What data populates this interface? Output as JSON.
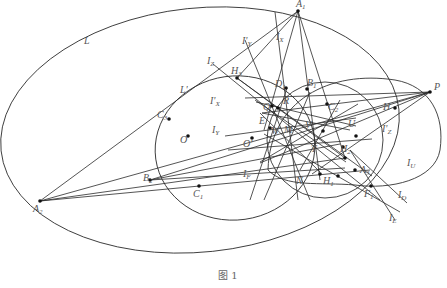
{
  "figure": {
    "caption": "图 1",
    "labels": [
      {
        "id": "L",
        "text": "L",
        "sub": ""
      },
      {
        "id": "Lp",
        "text": "L'",
        "sub": ""
      },
      {
        "id": "IZ",
        "text": "I",
        "sub": "Z"
      },
      {
        "id": "IpY",
        "text": "I'",
        "sub": "Y"
      },
      {
        "id": "IX",
        "text": "I",
        "sub": "X"
      },
      {
        "id": "A1",
        "text": "A",
        "sub": "1"
      },
      {
        "id": "H3",
        "text": "H",
        "sub": "3"
      },
      {
        "id": "D1",
        "text": "D",
        "sub": "1"
      },
      {
        "id": "B1",
        "text": "B",
        "sub": "1"
      },
      {
        "id": "C3",
        "text": "C",
        "sub": "3"
      },
      {
        "id": "Q",
        "text": "Q",
        "sub": ""
      },
      {
        "id": "R",
        "text": "R",
        "sub": ""
      },
      {
        "id": "C2",
        "text": "C",
        "sub": "2"
      },
      {
        "id": "H",
        "text": "H",
        "sub": ""
      },
      {
        "id": "P",
        "text": "P",
        "sub": ""
      },
      {
        "id": "IpX",
        "text": "I'",
        "sub": "X"
      },
      {
        "id": "IY",
        "text": "I",
        "sub": "Y"
      },
      {
        "id": "O",
        "text": "O",
        "sub": ""
      },
      {
        "id": "E",
        "text": "E",
        "sub": ""
      },
      {
        "id": "W",
        "text": "W",
        "sub": ""
      },
      {
        "id": "M",
        "text": "M",
        "sub": ""
      },
      {
        "id": "V",
        "text": "V",
        "sub": ""
      },
      {
        "id": "U",
        "text": "U",
        "sub": ""
      },
      {
        "id": "Op",
        "text": "O'",
        "sub": ""
      },
      {
        "id": "IpZ",
        "text": "I'",
        "sub": "Z"
      },
      {
        "id": "T",
        "text": "T",
        "sub": ""
      },
      {
        "id": "H2",
        "text": "H",
        "sub": "2"
      },
      {
        "id": "B2",
        "text": "B",
        "sub": "2"
      },
      {
        "id": "C1",
        "text": "C",
        "sub": "1"
      },
      {
        "id": "IF",
        "text": "I",
        "sub": "F"
      },
      {
        "id": "N",
        "text": "N",
        "sub": ""
      },
      {
        "id": "H1",
        "text": "H",
        "sub": "1"
      },
      {
        "id": "A3",
        "text": "A",
        "sub": "3"
      },
      {
        "id": "IU",
        "text": "I",
        "sub": "U"
      },
      {
        "id": "F1",
        "text": "F",
        "sub": "1"
      },
      {
        "id": "ID",
        "text": "I",
        "sub": "D"
      },
      {
        "id": "IE",
        "text": "I",
        "sub": "E"
      },
      {
        "id": "A2",
        "text": "A",
        "sub": "2"
      }
    ]
  }
}
